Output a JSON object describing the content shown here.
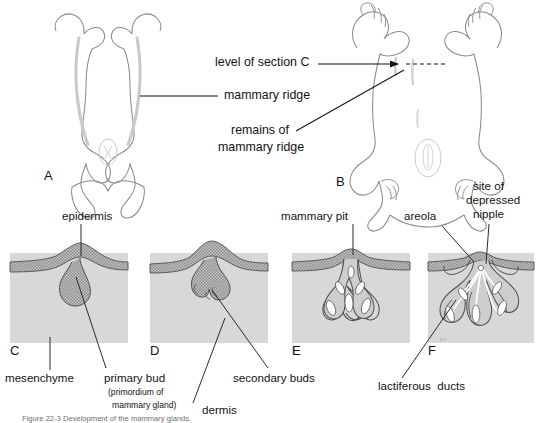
{
  "figure": {
    "kind": "embryology-plate",
    "subject": "Development of the mammary glands",
    "panel_letters": [
      "A",
      "B",
      "C",
      "D",
      "E",
      "F"
    ],
    "artist_signature": "hrt",
    "caption_partial": "Figure  22-3  Development of the mammary glands."
  },
  "colors": {
    "ink": "#131313",
    "leader": "#2a2a2a",
    "outline": "#6d6d6d",
    "mesenchyme_fill": "#d6d6d6",
    "mesenchyme_edge": "#bfbfbf",
    "epithelium_fill": "#a9a9a9",
    "epithelium_edge": "#4a4a4a",
    "lumen": "#ffffff",
    "page": "#ffffff"
  },
  "top_row": {
    "panel_a": {
      "letter": "A",
      "description": "ventral view of embryo showing paired mammary ridges"
    },
    "panel_b": {
      "letter": "B",
      "description": "ventral view of older fetus showing remains of mammary ridge"
    },
    "labels": [
      {
        "id": "level-of-section-c",
        "text": "level of section C"
      },
      {
        "id": "mammary-ridge",
        "text": "mammary ridge"
      },
      {
        "id": "remains-of-mammary-ridge",
        "line1": "remains of",
        "line2": "mammary ridge"
      }
    ]
  },
  "bottom_row": {
    "panels": [
      {
        "letter": "C",
        "stage": "primary bud"
      },
      {
        "letter": "D",
        "stage": "secondary buds"
      },
      {
        "letter": "E",
        "stage": "mammary pit"
      },
      {
        "letter": "F",
        "stage": "lactiferous ducts"
      }
    ],
    "labels": [
      {
        "id": "epidermis",
        "text": "epidermis"
      },
      {
        "id": "mesenchyme",
        "text": "mesenchyme"
      },
      {
        "id": "primary-bud",
        "text": "primary bud",
        "sub_line1": "(primordium of",
        "sub_line2": "mammary gland)"
      },
      {
        "id": "secondary-buds",
        "text": "secondary buds"
      },
      {
        "id": "dermis",
        "text": "dermis"
      },
      {
        "id": "mammary-pit",
        "text": "mammary pit"
      },
      {
        "id": "areola",
        "text": "areola"
      },
      {
        "id": "site-of-depressed-nipple",
        "line1": "site of",
        "line2": "depressed",
        "line3": "nipple"
      },
      {
        "id": "lactiferous-ducts",
        "text": "lactiferous  ducts"
      }
    ]
  }
}
